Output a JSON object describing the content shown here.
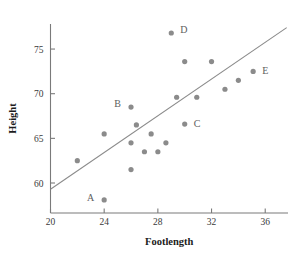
{
  "chart_data": {
    "type": "scatter",
    "title": "",
    "xlabel": "Footlength",
    "ylabel": "Height",
    "xlim": [
      20,
      37.8
    ],
    "ylim": [
      57.3,
      78.2
    ],
    "xticks": [
      20,
      24,
      28,
      32,
      36
    ],
    "yticks": [
      60,
      65,
      70,
      75
    ],
    "xtick_labels": [
      "20",
      "24",
      "28",
      "32",
      "36"
    ],
    "ytick_labels": [
      "60",
      "65",
      "70",
      "75"
    ],
    "grid": false,
    "legend": "none",
    "point_color": "#8b8b8b",
    "line_color": "#8b8b8b",
    "axis_color": "#7a7a7a",
    "points": [
      {
        "x": 22.0,
        "y": 62.5,
        "label": ""
      },
      {
        "x": 24.0,
        "y": 58.1,
        "label": "A"
      },
      {
        "x": 24.0,
        "y": 65.5,
        "label": ""
      },
      {
        "x": 26.0,
        "y": 68.5,
        "label": "B"
      },
      {
        "x": 26.0,
        "y": 61.5,
        "label": ""
      },
      {
        "x": 26.0,
        "y": 64.5,
        "label": ""
      },
      {
        "x": 26.4,
        "y": 66.5,
        "label": ""
      },
      {
        "x": 27.0,
        "y": 63.5,
        "label": ""
      },
      {
        "x": 27.5,
        "y": 65.5,
        "label": ""
      },
      {
        "x": 28.0,
        "y": 63.5,
        "label": ""
      },
      {
        "x": 28.6,
        "y": 64.5,
        "label": ""
      },
      {
        "x": 29.0,
        "y": 76.8,
        "label": "D"
      },
      {
        "x": 29.4,
        "y": 69.6,
        "label": ""
      },
      {
        "x": 30.0,
        "y": 66.6,
        "label": "C"
      },
      {
        "x": 30.0,
        "y": 73.6,
        "label": ""
      },
      {
        "x": 30.9,
        "y": 69.6,
        "label": ""
      },
      {
        "x": 32.0,
        "y": 73.6,
        "label": ""
      },
      {
        "x": 33.0,
        "y": 70.5,
        "label": ""
      },
      {
        "x": 34.0,
        "y": 71.5,
        "label": ""
      },
      {
        "x": 35.1,
        "y": 72.5,
        "label": "E"
      }
    ],
    "labeled_points": [
      {
        "label": "A",
        "x": 24.0,
        "y": 58.1
      },
      {
        "label": "B",
        "x": 26.0,
        "y": 68.5
      },
      {
        "label": "C",
        "x": 30.0,
        "y": 66.6
      },
      {
        "label": "D",
        "x": 29.0,
        "y": 76.8
      },
      {
        "label": "E",
        "x": 35.1,
        "y": 72.5
      }
    ],
    "fit_line": {
      "x1": 20.0,
      "y1": 59.3,
      "x2": 37.6,
      "y2": 77.4
    }
  }
}
